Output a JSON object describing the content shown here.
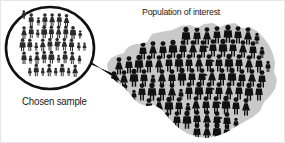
{
  "figure": {
    "kind": "statistics-sampling-diagram",
    "width": 285,
    "height": 143,
    "background_color": "#ffffff"
  },
  "population": {
    "title": "Population of interest",
    "map_fill_color": "#c9c9c9",
    "figure_color": "#111111",
    "person_count": 118
  },
  "sample": {
    "caption": "Chosen sample",
    "bubble_outline_color": "#111111",
    "bubble_fill_color": "#ffffff",
    "figure_color": "#2b2b2b",
    "person_count": 42
  },
  "pointer": {
    "color": "#111111",
    "direction": "bubble-to-map"
  }
}
